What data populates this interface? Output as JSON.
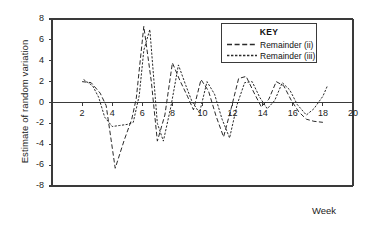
{
  "chart_data": {
    "type": "line",
    "title": "",
    "xlabel": "Week",
    "ylabel": "Estimate of random variation",
    "xlim": [
      0,
      20
    ],
    "ylim": [
      -8,
      8
    ],
    "xticks": [
      2,
      4,
      6,
      8,
      10,
      12,
      14,
      16,
      18,
      20
    ],
    "yticks": [
      8,
      6,
      4,
      2,
      0,
      -2,
      -4,
      -6,
      -8
    ],
    "grid": false,
    "zero_line": true,
    "legend": {
      "title": "KEY",
      "position": "top-right",
      "entries": [
        {
          "label": "Remainder (ii)",
          "style": "dashed"
        },
        {
          "label": "Remainder (iii)",
          "style": "dotted"
        }
      ]
    },
    "series": [
      {
        "name": "Remainder (ii)",
        "style": "dashed",
        "x": [
          2.0,
          2.6,
          3.2,
          3.6,
          4.2,
          4.8,
          5.3,
          5.6,
          6.1,
          6.6,
          7.0,
          7.5,
          8.0,
          8.5,
          9.0,
          9.4,
          9.9,
          10.4,
          10.9,
          11.4,
          11.9,
          12.4,
          12.9,
          13.4,
          13.9,
          14.4,
          14.9,
          15.4,
          15.9,
          16.4,
          16.9,
          17.4,
          18.0
        ],
        "y": [
          2.0,
          1.9,
          0.9,
          -0.3,
          -6.3,
          -3.6,
          -1.6,
          0.4,
          7.3,
          2.0,
          -3.7,
          -1.2,
          3.8,
          2.1,
          0.6,
          -0.7,
          2.2,
          1.1,
          -1.3,
          -3.3,
          -0.6,
          2.3,
          2.5,
          1.0,
          -0.4,
          0.3,
          2.0,
          1.6,
          0.2,
          -0.9,
          -1.6,
          -1.8,
          -1.9
        ]
      },
      {
        "name": "Remainder (iii)",
        "style": "dotted",
        "x": [
          2.1,
          2.7,
          3.1,
          3.5,
          4.0,
          4.5,
          5.0,
          5.4,
          5.8,
          6.1,
          6.5,
          7.0,
          7.4,
          7.9,
          8.4,
          8.9,
          9.3,
          9.8,
          10.3,
          10.8,
          11.3,
          11.8,
          12.3,
          12.8,
          13.3,
          13.8,
          14.3,
          14.8,
          15.3,
          15.8,
          16.3,
          16.9,
          17.4,
          18.0,
          18.3
        ],
        "y": [
          2.2,
          1.6,
          0.5,
          -1.4,
          -2.3,
          -2.2,
          -2.1,
          -1.9,
          0.7,
          5.0,
          7.0,
          -2.0,
          -3.7,
          -0.4,
          3.6,
          1.6,
          0.1,
          -1.0,
          2.0,
          0.8,
          -1.6,
          -3.4,
          -0.2,
          1.9,
          2.0,
          0.5,
          -0.6,
          0.2,
          1.9,
          1.2,
          -0.2,
          -1.2,
          -0.6,
          0.6,
          1.6
        ]
      }
    ]
  },
  "axis": {
    "ylabel_text": "Estimate of random variation",
    "xlabel_text": "Week"
  },
  "colors": {
    "axis": "#3a3a3a",
    "series_ii": "#2a2a2a",
    "series_iii": "#2a2a2a",
    "background": "#ffffff"
  }
}
